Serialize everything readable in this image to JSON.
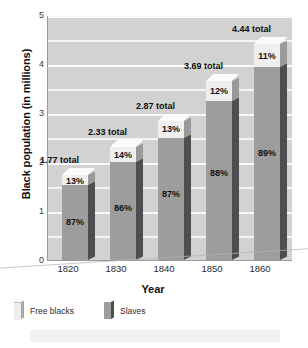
{
  "chart_data": {
    "type": "bar",
    "subtype": "stacked-3d-column",
    "title": "",
    "xlabel": "Year",
    "ylabel": "Black population (in millions)",
    "categories": [
      "1820",
      "1830",
      "1840",
      "1850",
      "1860"
    ],
    "ylim": [
      0,
      5
    ],
    "yticks": [
      0,
      1,
      2,
      3,
      4,
      5
    ],
    "ytick_labels": [
      "0",
      "1",
      "2",
      "3",
      "4",
      "5"
    ],
    "grid": true,
    "grid_interval": 0.5,
    "legend_position": "below-left",
    "series": [
      {
        "name": "Free blacks",
        "color": "#efefef",
        "values": [
          0.23,
          0.33,
          0.37,
          0.44,
          0.49
        ],
        "labels": [
          "13%",
          "14%",
          "13%",
          "12%",
          "11%"
        ]
      },
      {
        "name": "Slaves",
        "color": "#9d9d9d",
        "values": [
          1.54,
          2.0,
          2.5,
          3.25,
          3.95
        ],
        "labels": [
          "87%",
          "86%",
          "87%",
          "88%",
          "89%"
        ]
      }
    ],
    "totals": [
      1.77,
      2.33,
      2.87,
      3.69,
      4.44
    ],
    "total_labels": [
      "1.77 total",
      "2.33 total",
      "2.87 total",
      "3.69 total",
      "4.44 total"
    ],
    "bars": [
      {
        "year": "1820",
        "total": 1.77,
        "total_label": "1.77 total",
        "free_pct": "13%",
        "slave_pct": "87%"
      },
      {
        "year": "1830",
        "total": 2.33,
        "total_label": "2.33 total",
        "free_pct": "14%",
        "slave_pct": "86%"
      },
      {
        "year": "1840",
        "total": 2.87,
        "total_label": "2.87 total",
        "free_pct": "13%",
        "slave_pct": "87%"
      },
      {
        "year": "1850",
        "total": 3.69,
        "total_label": "3.69 total",
        "free_pct": "12%",
        "slave_pct": "88%"
      },
      {
        "year": "1860",
        "total": 4.44,
        "total_label": "4.44 total",
        "free_pct": "11%",
        "slave_pct": "89%"
      }
    ]
  },
  "axes": {
    "y_title": "Black population (in millions)",
    "x_title": "Year",
    "y_ticks": [
      "5",
      "4",
      "3",
      "2",
      "1",
      "0"
    ],
    "x_ticks": [
      "1820",
      "1830",
      "1840",
      "1850",
      "1860"
    ]
  },
  "legend": {
    "items": [
      {
        "label": "Free blacks",
        "color": "#efefef"
      },
      {
        "label": "Slaves",
        "color": "#9d9d9d"
      }
    ]
  },
  "colors": {
    "plot_background": "#d2d2d2",
    "gridline": "#f4f4f4",
    "free_blacks": "#efefef",
    "slaves": "#9d9d9d",
    "bar_side_shadow": "#4e4e4e",
    "axis": "#9a9a9a",
    "text": "#1a1a1a"
  }
}
